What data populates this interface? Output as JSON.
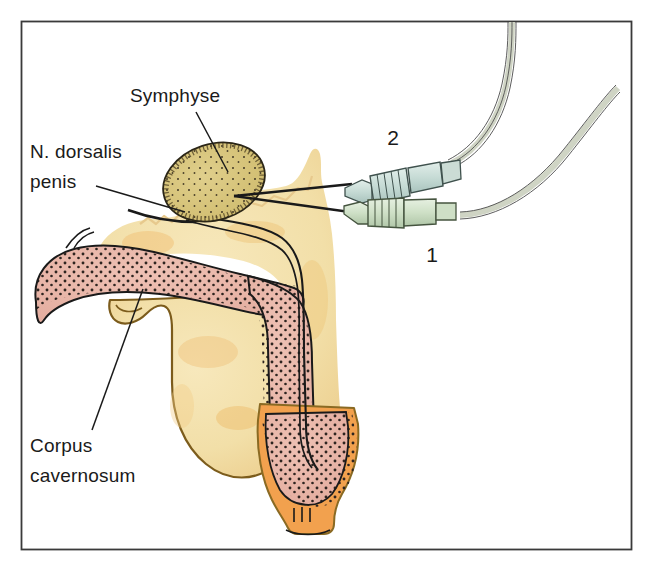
{
  "figure": {
    "domain": "medical-illustration",
    "background_color": "#ffffff",
    "border_color": "#3a3a3a"
  },
  "labels": [
    {
      "id": "symphyse",
      "text": "Symphyse",
      "x": 130,
      "y": 102,
      "anchor": "start",
      "leader": "M 196 112 L 228 172"
    },
    {
      "id": "n-dorsalis-penis",
      "text_line_1": "N. dorsalis",
      "text_line_2": "penis",
      "x": 30,
      "y": 158,
      "anchor": "start",
      "leader": "M 96 186 L 185 212"
    },
    {
      "id": "corpus-cavernosum",
      "text_line_1": "Corpus",
      "text_line_2": "cavernosum",
      "x": 30,
      "y": 452,
      "anchor": "start",
      "leader": "M 92 430 L 143 289"
    }
  ],
  "callout_numbers": [
    {
      "id": "needle-2",
      "text": "2",
      "x": 393,
      "y": 145
    },
    {
      "id": "needle-1",
      "text": "1",
      "x": 432,
      "y": 262
    }
  ],
  "colors": {
    "symphysis_fill": "#d8c67c",
    "symphysis_stipple": "#3d3524",
    "corpus_cavernosum_fill": "#e9b7aa",
    "corpus_cavernosum_stipple": "#2e2420",
    "soft_tissue_fill": "#f3e0a9",
    "soft_tissue_shadow": "#eec274",
    "glans_skin_fill": "#f2a14e",
    "skin_outline": "#8a6a23",
    "outline": "#1a1a1a",
    "needle_hub_fill": "#c9ddd7",
    "needle_hub_fill_alt": "#d4e3cf",
    "tubing_fill": "#cfd4c4",
    "tubing_outline": "#4a4a4a",
    "label_text": "#1a1a1a",
    "frame": "#3a3a3a"
  },
  "structures": [
    {
      "id": "pubic-symphysis",
      "label": "Symphyse",
      "description": "stippled olive-khaki oval bone cross-section"
    },
    {
      "id": "dorsal-nerve",
      "label": "N. dorsalis penis",
      "description": "thin paired dark lines running along the dorsum of the penis"
    },
    {
      "id": "corpus-cavernosum-body",
      "label": "Corpus cavernosum",
      "description": "pink stippled erectile tissue forming the crus and shaft"
    },
    {
      "id": "scrotum-testis",
      "label": "",
      "description": "rounded yellow-cream structure below the crus"
    },
    {
      "id": "glans",
      "label": "",
      "description": "distal orange-skinned tip with pink stippled core"
    },
    {
      "id": "needle-hub-upper",
      "label": "2",
      "description": "upper luer-lock needle connector with tubing"
    },
    {
      "id": "needle-hub-lower",
      "label": "1",
      "description": "lower luer-lock needle connector with tubing"
    }
  ]
}
